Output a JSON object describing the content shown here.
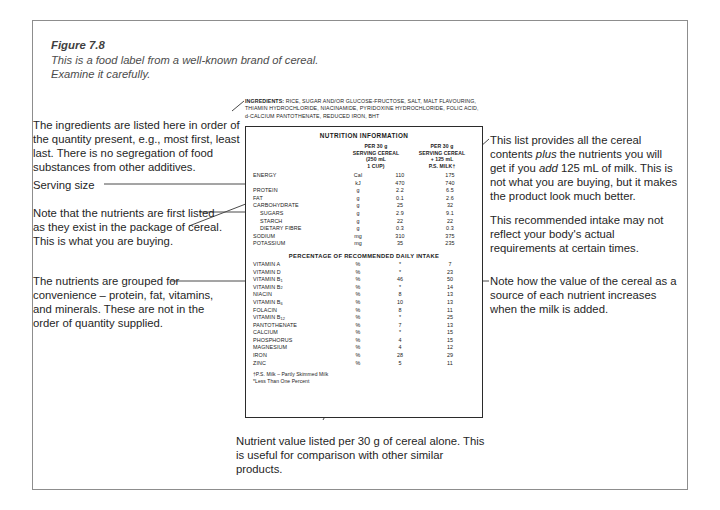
{
  "figure": {
    "number": "Figure 7.8",
    "caption": "This is a food label from a well-known brand of cereal. Examine it carefully."
  },
  "ingredients": {
    "heading": "INGREDIENTS:",
    "text": "RICE, SUGAR AND/OR GLUCOSE-FRUCTOSE, SALT, MALT FLAVOURING, THIAMIN HYDROCHLORIDE, NIACINAMIDE, PYRIDOXINE HYDROCHLORIDE, FOLIC ACID, d-CALCIUM PANTOTHENATE, REDUCED IRON, BHT"
  },
  "label": {
    "title": "NUTRITION INFORMATION",
    "column1_header": "PER 30 g\nSERVING CEREAL\n(250 mL\n1 CUP)",
    "column2_header": "PER 30 g\nSERVING CEREAL\n+ 125 mL\nP.S. MILK†",
    "col1_line1": "PER 30 g",
    "col1_line2": "SERVING CEREAL",
    "col1_line3": "(250 mL",
    "col1_line4": "1 CUP)",
    "col2_line1": "PER 30 g",
    "col2_line2": "SERVING CEREAL",
    "col2_line3": "+ 125 mL",
    "col2_line4": "P.S. MILK†",
    "percent_section_header": "PERCENTAGE OF RECOMMENDED DAILY INTAKE",
    "footnote1": "†P.S. Milk – Partly Skimmed Milk",
    "footnote2": "*Less Than One Percent",
    "nutrients": [
      {
        "name": "ENERGY",
        "indent": false,
        "unit": "Cal",
        "cereal": "110",
        "with_milk": "175"
      },
      {
        "name": "",
        "indent": false,
        "unit": "kJ",
        "cereal": "470",
        "with_milk": "740"
      },
      {
        "name": "PROTEIN",
        "indent": false,
        "unit": "g",
        "cereal": "2.2",
        "with_milk": "6.5"
      },
      {
        "name": "FAT",
        "indent": false,
        "unit": "g",
        "cereal": "0.1",
        "with_milk": "2.6"
      },
      {
        "name": "CARBOHYDRATE",
        "indent": false,
        "unit": "g",
        "cereal": "25",
        "with_milk": "32"
      },
      {
        "name": "SUGARS",
        "indent": true,
        "unit": "g",
        "cereal": "2.9",
        "with_milk": "9.1"
      },
      {
        "name": "STARCH",
        "indent": true,
        "unit": "g",
        "cereal": "22",
        "with_milk": "22"
      },
      {
        "name": "DIETARY FIBRE",
        "indent": true,
        "unit": "g",
        "cereal": "0.3",
        "with_milk": "0.3"
      },
      {
        "name": "SODIUM",
        "indent": false,
        "unit": "mg",
        "cereal": "310",
        "with_milk": "375"
      },
      {
        "name": "POTASSIUM",
        "indent": false,
        "unit": "mg",
        "cereal": "35",
        "with_milk": "235"
      }
    ],
    "daily_intake": [
      {
        "name": "VITAMIN A",
        "sub": "",
        "unit": "%",
        "cereal": "*",
        "with_milk": "7"
      },
      {
        "name": "VITAMIN D",
        "sub": "",
        "unit": "%",
        "cereal": "*",
        "with_milk": "23"
      },
      {
        "name": "VITAMIN B",
        "sub": "1",
        "unit": "%",
        "cereal": "46",
        "with_milk": "50"
      },
      {
        "name": "VITAMIN B",
        "sub": "2",
        "unit": "%",
        "cereal": "*",
        "with_milk": "14"
      },
      {
        "name": "NIACIN",
        "sub": "",
        "unit": "%",
        "cereal": "8",
        "with_milk": "13"
      },
      {
        "name": "VITAMIN B",
        "sub": "6",
        "unit": "%",
        "cereal": "10",
        "with_milk": "13"
      },
      {
        "name": "FOLACIN",
        "sub": "",
        "unit": "%",
        "cereal": "8",
        "with_milk": "11"
      },
      {
        "name": "VITAMIN B",
        "sub": "12",
        "unit": "%",
        "cereal": "*",
        "with_milk": "25"
      },
      {
        "name": "PANTOTHENATE",
        "sub": "",
        "unit": "%",
        "cereal": "7",
        "with_milk": "13"
      },
      {
        "name": "CALCIUM",
        "sub": "",
        "unit": "%",
        "cereal": "*",
        "with_milk": "15"
      },
      {
        "name": "PHOSPHORUS",
        "sub": "",
        "unit": "%",
        "cereal": "4",
        "with_milk": "15"
      },
      {
        "name": "MAGNESIUM",
        "sub": "",
        "unit": "%",
        "cereal": "4",
        "with_milk": "12"
      },
      {
        "name": "IRON",
        "sub": "",
        "unit": "%",
        "cereal": "28",
        "with_milk": "29"
      },
      {
        "name": "ZINC",
        "sub": "",
        "unit": "%",
        "cereal": "5",
        "with_milk": "11"
      }
    ]
  },
  "annotations": {
    "ingredients_note": "The ingredients are listed here in order of the quantity present, e.g., most first, least last. There is no segregation of food substances from other additives.",
    "serving_size": "Serving size",
    "package_note_a": "Note that the nutrients are first listed",
    "package_note_b": "as they exist in the package of cereal.",
    "package_note_c": "This is what you are buying.",
    "grouping_note_a": "The nutrients are grouped for",
    "grouping_note_b": "convenience – protein, fat, vitamins,",
    "grouping_note_c": "and minerals. These are not in the",
    "grouping_note_d": "order of quantity supplied.",
    "milk_note_a": "This list provides all the cereal",
    "milk_note_b_pre": "contents ",
    "milk_note_b_em": "plus",
    "milk_note_b_post": " the nutrients you will",
    "milk_note_c_pre": "get if you ",
    "milk_note_c_em": "add",
    "milk_note_c_post": " 125 mL of milk. This is",
    "milk_note_d": "not what you are buying, but it makes",
    "milk_note_e": "the product look much better.",
    "intake_note_a": "This recommended intake may not",
    "intake_note_b": "reflect your body's actual",
    "intake_note_c": "requirements at certain times.",
    "value_note_a": "Note how the value of the cereal as a",
    "value_note_b": "source of each nutrient increases",
    "value_note_c": "when the milk is added.",
    "bottom_note_a": "Nutrient value listed per 30 g of cereal alone. This",
    "bottom_note_b": "is useful for comparison with other similar",
    "bottom_note_c": "products."
  }
}
